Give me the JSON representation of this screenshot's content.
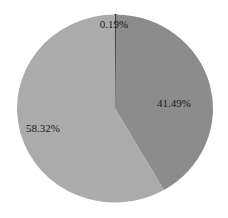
{
  "chart_data": {
    "type": "pie",
    "title": "",
    "categories": [
      "Slice A",
      "Slice B",
      "Slice C"
    ],
    "values": [
      0.19,
      41.49,
      58.32
    ],
    "labels": [
      "0.19%",
      "41.49%",
      "58.32%"
    ],
    "colors": [
      "#3a3a3a",
      "#8c8c8c",
      "#ababab"
    ],
    "start_angle_deg": 0,
    "direction": "clockwise",
    "legend": "none"
  },
  "layout": {
    "cx": 115,
    "cy": 108.5,
    "rx": 98,
    "ry": 94,
    "label_positions": [
      {
        "x": 114,
        "y": 28
      },
      {
        "x": 174,
        "y": 107
      },
      {
        "x": 43,
        "y": 132
      }
    ]
  }
}
